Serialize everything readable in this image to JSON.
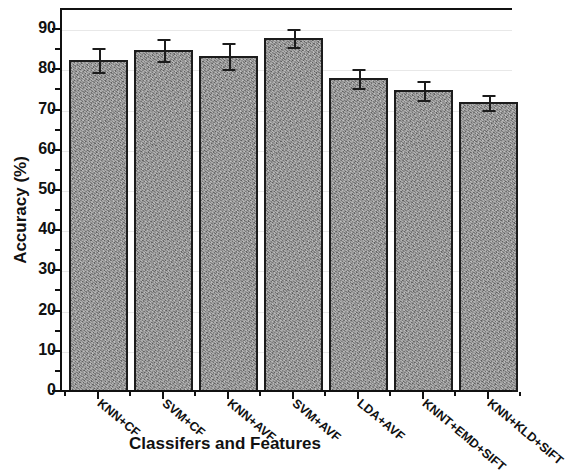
{
  "chart_data": {
    "type": "bar",
    "title": "",
    "xlabel": "Classifers and Features",
    "ylabel": "Accuracy (%)",
    "categories": [
      "KNN+CF",
      "SVM+CF",
      "KNN+AVF",
      "SVM+AVF",
      "LDA+AVF",
      "KNNT+EMD+SIFT",
      "KNN+KLD+SIFT"
    ],
    "values": [
      82.5,
      85.0,
      83.5,
      88.0,
      78.0,
      75.0,
      72.0
    ],
    "errors": [
      3.0,
      2.7,
      3.2,
      2.3,
      2.3,
      2.4,
      1.8
    ],
    "ylim": [
      0,
      95
    ],
    "yticks": [
      0,
      10,
      20,
      30,
      40,
      50,
      60,
      70,
      80,
      90
    ],
    "ytick_labels": [
      "0",
      "10",
      "20",
      "30",
      "40",
      "50",
      "60",
      "70",
      "80",
      "90"
    ],
    "yminor_step": 5,
    "grid": true,
    "grid_axis": "y",
    "legend": null,
    "bar_color": "#8e8e8e",
    "bar_edge_color": "#1c1c1c",
    "axis_color": "#111111",
    "grid_color": "#e8e8e8",
    "background": "#ffffff",
    "bar_width_fraction": 0.9,
    "error_bar_style": "upper-and-lower-cap"
  }
}
